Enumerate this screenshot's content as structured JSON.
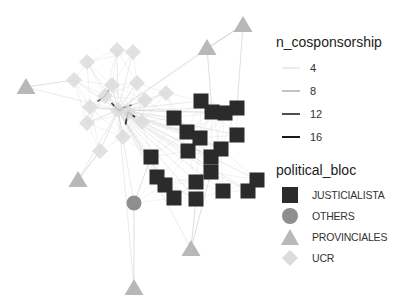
{
  "chart_data": {
    "type": "network",
    "title": "",
    "legend_position": "right",
    "legends": [
      {
        "title": "n_cosponsorship",
        "kind": "edge_width_alpha",
        "entries": [
          {
            "label": "4",
            "color": "#d9d9d9",
            "width": 1
          },
          {
            "label": "8",
            "color": "#9a9a9a",
            "width": 1.2
          },
          {
            "label": "12",
            "color": "#3a3a3a",
            "width": 1.8
          },
          {
            "label": "16",
            "color": "#1a1a1a",
            "width": 2
          }
        ]
      },
      {
        "title": "political_bloc",
        "kind": "node_shape_color",
        "entries": [
          {
            "label": "JUSTICIALISTA",
            "shape": "square",
            "color": "#2b2b2b"
          },
          {
            "label": "OTHERS",
            "shape": "circle",
            "color": "#8e8e8e"
          },
          {
            "label": "PROVINCIALES",
            "shape": "triangle",
            "color": "#b8b8b8"
          },
          {
            "label": "UCR",
            "shape": "diamond",
            "color": "#dcdcdc"
          }
        ]
      }
    ],
    "nodes": [
      {
        "bloc": "JUSTICIALISTA",
        "x": 201,
        "y": 101
      },
      {
        "bloc": "JUSTICIALISTA",
        "x": 212,
        "y": 112
      },
      {
        "bloc": "JUSTICIALISTA",
        "x": 225,
        "y": 113
      },
      {
        "bloc": "JUSTICIALISTA",
        "x": 237,
        "y": 108
      },
      {
        "bloc": "JUSTICIALISTA",
        "x": 174,
        "y": 118
      },
      {
        "bloc": "JUSTICIALISTA",
        "x": 187,
        "y": 132
      },
      {
        "bloc": "JUSTICIALISTA",
        "x": 200,
        "y": 138
      },
      {
        "bloc": "JUSTICIALISTA",
        "x": 237,
        "y": 135
      },
      {
        "bloc": "JUSTICIALISTA",
        "x": 188,
        "y": 151
      },
      {
        "bloc": "JUSTICIALISTA",
        "x": 221,
        "y": 149
      },
      {
        "bloc": "JUSTICIALISTA",
        "x": 211,
        "y": 157
      },
      {
        "bloc": "JUSTICIALISTA",
        "x": 151,
        "y": 157
      },
      {
        "bloc": "JUSTICIALISTA",
        "x": 211,
        "y": 172
      },
      {
        "bloc": "JUSTICIALISTA",
        "x": 157,
        "y": 177
      },
      {
        "bloc": "JUSTICIALISTA",
        "x": 165,
        "y": 185
      },
      {
        "bloc": "JUSTICIALISTA",
        "x": 174,
        "y": 198
      },
      {
        "bloc": "JUSTICIALISTA",
        "x": 196,
        "y": 182
      },
      {
        "bloc": "JUSTICIALISTA",
        "x": 196,
        "y": 199
      },
      {
        "bloc": "JUSTICIALISTA",
        "x": 223,
        "y": 191
      },
      {
        "bloc": "JUSTICIALISTA",
        "x": 257,
        "y": 180
      },
      {
        "bloc": "JUSTICIALISTA",
        "x": 248,
        "y": 191
      },
      {
        "bloc": "OTHERS",
        "x": 134,
        "y": 203
      },
      {
        "bloc": "PROVINCIALES",
        "x": 243,
        "y": 25
      },
      {
        "bloc": "PROVINCIALES",
        "x": 207,
        "y": 48
      },
      {
        "bloc": "PROVINCIALES",
        "x": 26,
        "y": 87
      },
      {
        "bloc": "PROVINCIALES",
        "x": 78,
        "y": 180
      },
      {
        "bloc": "PROVINCIALES",
        "x": 191,
        "y": 249
      },
      {
        "bloc": "PROVINCIALES",
        "x": 134,
        "y": 288
      },
      {
        "bloc": "UCR",
        "x": 117,
        "y": 50
      },
      {
        "bloc": "UCR",
        "x": 133,
        "y": 52
      },
      {
        "bloc": "UCR",
        "x": 87,
        "y": 62
      },
      {
        "bloc": "UCR",
        "x": 74,
        "y": 80
      },
      {
        "bloc": "UCR",
        "x": 112,
        "y": 85
      },
      {
        "bloc": "UCR",
        "x": 137,
        "y": 83
      },
      {
        "bloc": "UCR",
        "x": 90,
        "y": 107
      },
      {
        "bloc": "UCR",
        "x": 87,
        "y": 123
      },
      {
        "bloc": "UCR",
        "x": 145,
        "y": 100
      },
      {
        "bloc": "UCR",
        "x": 142,
        "y": 122
      },
      {
        "bloc": "UCR",
        "x": 123,
        "y": 137
      },
      {
        "bloc": "UCR",
        "x": 100,
        "y": 151
      },
      {
        "bloc": "UCR",
        "x": 166,
        "y": 93
      },
      {
        "bloc": "UCR",
        "x": 118,
        "y": 110
      },
      {
        "bloc": "UCR",
        "x": 105,
        "y": 96
      },
      {
        "bloc": "UCR",
        "x": 128,
        "y": 112
      }
    ],
    "hub": {
      "x": 118,
      "y": 110
    }
  }
}
